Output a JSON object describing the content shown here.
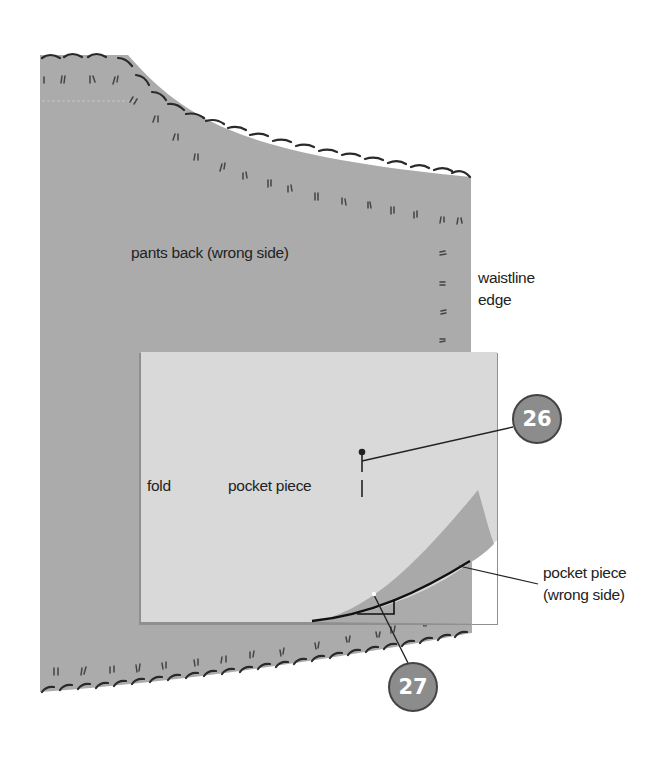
{
  "diagram": {
    "colors": {
      "pants_back": "#ababab",
      "pocket_piece": "#d9d9d9",
      "pocket_wrong_side": "#a9a9a9",
      "stitch": "#333333",
      "badge_fill": "#8c8c8c",
      "badge_border": "#444444"
    },
    "labels": {
      "pants_back": "pants back (wrong side)",
      "waistline_line1": "waistline",
      "waistline_line2": "edge",
      "fold": "fold",
      "pocket_piece": "pocket piece",
      "pocket_wrong_line1": "pocket piece",
      "pocket_wrong_line2": "(wrong side)"
    },
    "callouts": [
      {
        "number": "26",
        "target": "pin marker on pocket piece"
      },
      {
        "number": "27",
        "target": "corner point on curved stitch line"
      }
    ]
  }
}
